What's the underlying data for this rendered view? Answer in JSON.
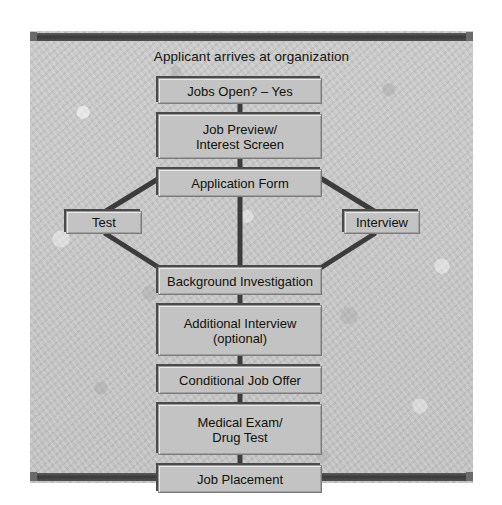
{
  "diagram": {
    "title": "Applicant arrives at organization",
    "type": "flowchart",
    "orientation": "top-to-bottom",
    "colors": {
      "background": "#ffffff",
      "frame_fill": "#c6c6c6",
      "frame_bar": "#3f3f3f",
      "node_fill": "#c3c3c3",
      "node_border": "#7b7b7b",
      "node_shadow": "#4a4a4a",
      "connector": "#3c3c3c",
      "text": "#111109"
    },
    "nodes": [
      {
        "id": "jobs-open",
        "label": "Jobs Open? – Yes",
        "lane": "center"
      },
      {
        "id": "job-preview",
        "label": "Job Preview/\nInterest Screen",
        "lane": "center"
      },
      {
        "id": "application-form",
        "label": "Application Form",
        "lane": "center"
      },
      {
        "id": "test",
        "label": "Test",
        "lane": "left"
      },
      {
        "id": "interview",
        "label": "Interview",
        "lane": "right"
      },
      {
        "id": "background",
        "label": "Background Investigation",
        "lane": "center"
      },
      {
        "id": "additional",
        "label": "Additional Interview\n(optional)",
        "lane": "center"
      },
      {
        "id": "conditional",
        "label": "Conditional Job Offer",
        "lane": "center"
      },
      {
        "id": "medical",
        "label": "Medical Exam/\nDrug Test",
        "lane": "center"
      },
      {
        "id": "placement",
        "label": "Job Placement",
        "lane": "center"
      }
    ],
    "edges": [
      {
        "from": "jobs-open",
        "to": "job-preview",
        "style": "vertical"
      },
      {
        "from": "job-preview",
        "to": "application-form",
        "style": "vertical"
      },
      {
        "from": "application-form",
        "to": "test",
        "style": "diagonal"
      },
      {
        "from": "application-form",
        "to": "interview",
        "style": "diagonal"
      },
      {
        "from": "application-form",
        "to": "background",
        "style": "vertical"
      },
      {
        "from": "test",
        "to": "background",
        "style": "diagonal"
      },
      {
        "from": "interview",
        "to": "background",
        "style": "diagonal"
      },
      {
        "from": "background",
        "to": "additional",
        "style": "vertical"
      },
      {
        "from": "additional",
        "to": "conditional",
        "style": "vertical"
      },
      {
        "from": "conditional",
        "to": "medical",
        "style": "vertical"
      },
      {
        "from": "medical",
        "to": "placement",
        "style": "vertical"
      }
    ]
  }
}
